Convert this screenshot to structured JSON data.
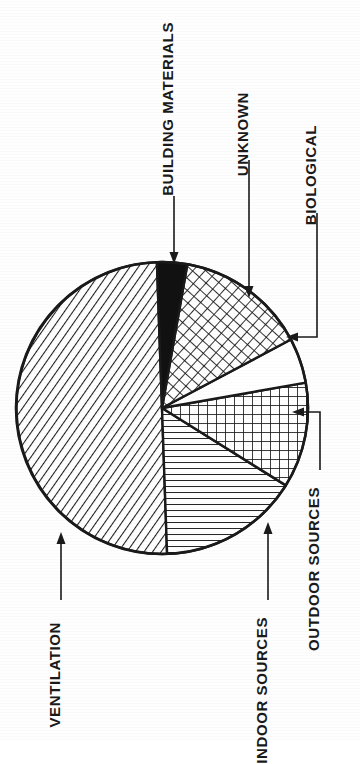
{
  "figure": {
    "kind": "pie-chart",
    "orientation": "rotated-90-ccw",
    "background_color": "#ffffff",
    "ink_color": "#1a1a1a"
  },
  "chart_data": {
    "type": "pie",
    "title": "",
    "subtitle": "",
    "xlabel": "",
    "ylabel": "",
    "legend_position": "none",
    "labels_placement": "external-leader-lines",
    "grid": false,
    "categories": [
      "VENTILATION",
      "INDOOR SOURCES",
      "OUTDOOR SOURCES",
      "BIOLOGICAL",
      "UNKNOWN",
      "BUILDING MATERIALS"
    ],
    "values": [
      50,
      16,
      11,
      5,
      15,
      3
    ],
    "units": "percent",
    "slices": [
      {
        "label": "VENTILATION",
        "value": 50,
        "fill": "diagonal-hatch",
        "fill_color": "#ffffff",
        "stroke_color": "#1a1a1a",
        "start_angle_deg": 178,
        "end_angle_deg": 358
      },
      {
        "label": "INDOOR SOURCES",
        "value": 16,
        "fill": "horizontal-lines",
        "fill_color": "#ffffff",
        "stroke_color": "#1a1a1a",
        "start_angle_deg": 122,
        "end_angle_deg": 178
      },
      {
        "label": "OUTDOOR SOURCES",
        "value": 11,
        "fill": "square-grid",
        "fill_color": "#ffffff",
        "stroke_color": "#1a1a1a",
        "start_angle_deg": 80,
        "end_angle_deg": 122
      },
      {
        "label": "BIOLOGICAL",
        "value": 5,
        "fill": "blank-white",
        "fill_color": "#ffffff",
        "stroke_color": "#1a1a1a",
        "start_angle_deg": 62,
        "end_angle_deg": 80
      },
      {
        "label": "UNKNOWN",
        "value": 15,
        "fill": "diagonal-cross-hatch",
        "fill_color": "#ffffff",
        "stroke_color": "#1a1a1a",
        "start_angle_deg": 10,
        "end_angle_deg": 62
      },
      {
        "label": "BUILDING MATERIALS",
        "value": 3,
        "fill": "solid-black",
        "fill_color": "#111111",
        "stroke_color": "#1a1a1a",
        "start_angle_deg": 358,
        "end_angle_deg": 370
      }
    ]
  },
  "labels": {
    "building_materials": "BUILDING MATERIALS",
    "unknown": "UNKNOWN",
    "biological": "BIOLOGICAL",
    "outdoor_sources": "OUTDOOR SOURCES",
    "indoor_sources": "INDOOR SOURCES",
    "ventilation": "VENTILATION"
  }
}
